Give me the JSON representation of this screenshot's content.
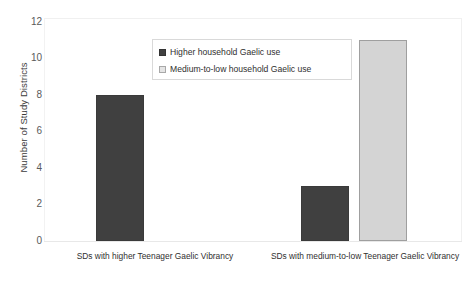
{
  "chart_data": {
    "type": "bar",
    "title": "",
    "xlabel": "",
    "ylabel": "Number of Study Districts",
    "ylim": [
      0,
      12
    ],
    "yticks": [
      0,
      2,
      4,
      6,
      8,
      10,
      12
    ],
    "grid": false,
    "legend_position": "top-center",
    "categories": [
      "SDs with higher Teenager Gaelic Vibrancy",
      "SDs with medium-to-low Teenager  Gaelic Vibrancy"
    ],
    "series": [
      {
        "name": "Higher household Gaelic use",
        "values": [
          8,
          3
        ],
        "color": "#404040"
      },
      {
        "name": "Medium-to-low household Gaelic use",
        "values": [
          null,
          11
        ],
        "color": "#d4d4d4"
      }
    ],
    "bars": [
      {
        "group": 0,
        "series": 0,
        "value": 8,
        "label": "8"
      },
      {
        "group": 1,
        "series": 0,
        "value": 3,
        "label": "3"
      },
      {
        "group": 1,
        "series": 1,
        "value": 11,
        "label": "11"
      }
    ]
  },
  "axis": {
    "y_title": "Number of Study Districts",
    "y_ticks": [
      "12",
      "10",
      "8",
      "6",
      "4",
      "2",
      "0"
    ]
  },
  "legend": {
    "items": [
      {
        "label": "Higher household Gaelic use",
        "swatch": "dark"
      },
      {
        "label": "Medium-to-low household Gaelic use",
        "swatch": "light"
      }
    ]
  },
  "x_labels": [
    "SDs with higher Teenager Gaelic Vibrancy",
    "SDs with medium-to-low Teenager  Gaelic Vibrancy"
  ],
  "caption": "",
  "colors": {
    "dark_bar": "#404040",
    "light_bar": "#d4d4d4",
    "frame": "#f0f0f0",
    "text": "#2f2f2f"
  }
}
